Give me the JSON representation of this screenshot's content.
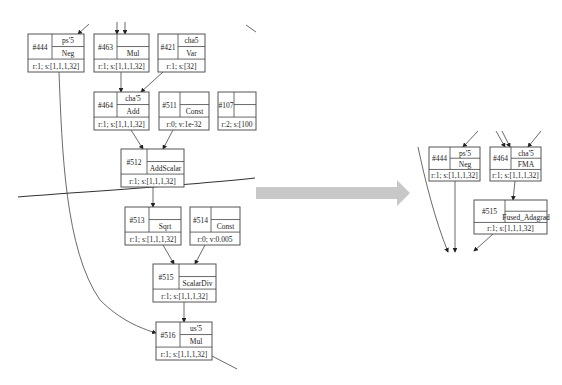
{
  "before_graph": {
    "nodes": [
      {
        "id": "#444",
        "var": "ps'5",
        "op": "Neg",
        "info": "r:1; s:[1,1,1,32]",
        "x": 28,
        "y": 34,
        "w": 56,
        "h": 38
      },
      {
        "id": "#463",
        "var": "",
        "op": "Mul",
        "info": "r:1; s:[1,1,1,32]",
        "x": 94,
        "y": 34,
        "w": 55,
        "h": 38
      },
      {
        "id": "#421",
        "var": "cha5",
        "op": "Var",
        "info": "r:1; s:[32]",
        "x": 158,
        "y": 34,
        "w": 47,
        "h": 38
      },
      {
        "id": "#464",
        "var": "cha'5",
        "op": "Add",
        "info": "r:1; s:[1,1,1,32]",
        "x": 94,
        "y": 92,
        "w": 55,
        "h": 38
      },
      {
        "id": "#511",
        "var": "",
        "op": "Const",
        "info": "r:0; v:1e-32",
        "x": 159,
        "y": 92,
        "w": 50,
        "h": 38
      },
      {
        "id": "#107",
        "var": "",
        "op": "",
        "info": "r:2; s:[100",
        "x": 218,
        "y": 92,
        "w": 38,
        "h": 38
      },
      {
        "id": "#512",
        "var": "",
        "op": "AddScalar",
        "info": "r:1; s:[1,1,1,32]",
        "x": 121,
        "y": 149,
        "w": 63,
        "h": 38
      },
      {
        "id": "#513",
        "var": "",
        "op": "Sqrt",
        "info": "r:1; s:[1,1,1,32]",
        "x": 125,
        "y": 207,
        "w": 56,
        "h": 38
      },
      {
        "id": "#514",
        "var": "",
        "op": "Const",
        "info": "r:0; v:0.005",
        "x": 190,
        "y": 207,
        "w": 50,
        "h": 38
      },
      {
        "id": "#515",
        "var": "",
        "op": "ScalarDiv",
        "info": "r:1; s:[1,1,1,32]",
        "x": 153,
        "y": 264,
        "w": 63,
        "h": 38
      },
      {
        "id": "#516",
        "var": "us'5",
        "op": "Mul",
        "info": "r:1; s:[1,1,1,32]",
        "x": 156,
        "y": 322,
        "w": 56,
        "h": 38
      }
    ]
  },
  "after_graph": {
    "nodes": [
      {
        "id": "#444",
        "var": "ps'5",
        "op": "Neg",
        "info": "r:1; s:[1,1,1,32]",
        "x": 429,
        "y": 147,
        "w": 51,
        "h": 34
      },
      {
        "id": "#464",
        "var": "cha'5",
        "op": "FMA",
        "info": "r:1; s:[1,1,1,32]",
        "x": 490,
        "y": 147,
        "w": 51,
        "h": 34
      },
      {
        "id": "#515",
        "var": "",
        "op": "Fused_Adagrad",
        "info": "r:1; s:[1,1,1,32]",
        "x": 474,
        "y": 200,
        "w": 73,
        "h": 34
      }
    ]
  },
  "transform_arrow": {
    "color": "#c8c8c8",
    "direction": "right"
  }
}
